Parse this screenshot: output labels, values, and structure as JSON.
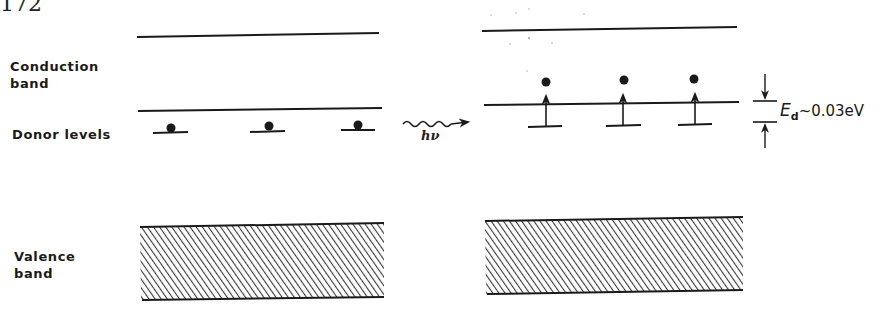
{
  "figure": {
    "page_number": "172",
    "labels": {
      "conduction_band_line1": "Conduction",
      "conduction_band_line2": "band",
      "donor_levels": "Donor levels",
      "valence_band_line1": "Valence",
      "valence_band_line2": "band"
    },
    "photon": {
      "label": "hν"
    },
    "energy_gap": {
      "symbol": "E",
      "subscript": "d",
      "value_text": "~0.03eV"
    },
    "left_panel": {
      "state": "before excitation",
      "donor_count": 3,
      "electrons_on_donor_levels": 3
    },
    "right_panel": {
      "state": "after excitation",
      "donor_count": 3,
      "electrons_excited_to_conduction_band": 3
    },
    "colors": {
      "ink": "#1a1a1a",
      "background": "#ffffff"
    }
  }
}
